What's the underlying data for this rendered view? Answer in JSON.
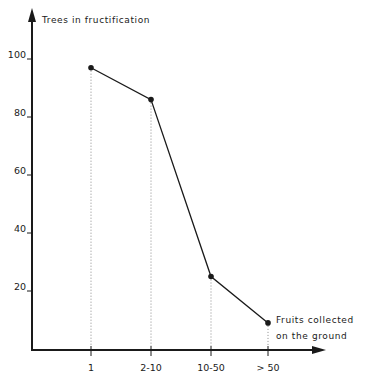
{
  "chart_data": {
    "type": "line",
    "title": "",
    "ylabel": "Trees in fructification",
    "xlabel_line1": "Fruits collected",
    "xlabel_line2": "on the ground",
    "categories": [
      "1",
      "2-10",
      "10-50",
      "> 50"
    ],
    "values": [
      97,
      86,
      25,
      9
    ],
    "yticks": [
      "20",
      "40",
      "60",
      "80",
      "100"
    ],
    "ylim": [
      0,
      110
    ],
    "grid": false,
    "drop_lines": "dotted vertical lines from each point to x-axis",
    "legend": null
  },
  "colors": {
    "ink": "#1a1a1a",
    "dotted": "#8a8a8a",
    "background": "#ffffff"
  }
}
